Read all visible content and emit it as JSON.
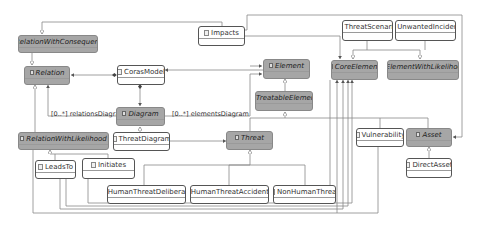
{
  "diagram": {
    "type": "uml-class-diagram",
    "classes": [
      {
        "id": "relationWithConsequence",
        "name": "RelationWithConsequence",
        "abstract": true
      },
      {
        "id": "relation",
        "name": "Relation",
        "abstract": true
      },
      {
        "id": "corasModel",
        "name": "CorasModel",
        "abstract": false
      },
      {
        "id": "impacts",
        "name": "Impacts",
        "abstract": false
      },
      {
        "id": "diagram",
        "name": "Diagram",
        "abstract": true
      },
      {
        "id": "element",
        "name": "Element",
        "abstract": true
      },
      {
        "id": "treatableElement",
        "name": "TreatableElement",
        "abstract": true
      },
      {
        "id": "coreElement",
        "name": "CoreElement",
        "abstract": true
      },
      {
        "id": "elementWithLikelihood",
        "name": "ElementWithLikelihood",
        "abstract": true
      },
      {
        "id": "threatScenario",
        "name": "ThreatScenario",
        "abstract": false
      },
      {
        "id": "unwantedIncident",
        "name": "UnwantedIncident",
        "abstract": false
      },
      {
        "id": "relationWithLikelihood",
        "name": "RelationWithLikelihood",
        "abstract": true
      },
      {
        "id": "threatDiagram",
        "name": "ThreatDiagram",
        "abstract": false
      },
      {
        "id": "leadsTo",
        "name": "LeadsTo",
        "abstract": false
      },
      {
        "id": "initiates",
        "name": "Initiates",
        "abstract": false
      },
      {
        "id": "threat",
        "name": "Threat",
        "abstract": true
      },
      {
        "id": "vulnerability",
        "name": "Vulnerability",
        "abstract": false
      },
      {
        "id": "asset",
        "name": "Asset",
        "abstract": true
      },
      {
        "id": "directAsset",
        "name": "DirectAsset",
        "abstract": false
      },
      {
        "id": "humanThreatDeliberate",
        "name": "HumanThreatDeliberate",
        "abstract": false
      },
      {
        "id": "humanThreatAccidental",
        "name": "HumanThreatAccidental",
        "abstract": false
      },
      {
        "id": "nonHumanThreat",
        "name": "NonHumanThreat",
        "abstract": false
      }
    ],
    "association_labels": {
      "relationsDiagram": "[0..*] relationsDiagram",
      "elementsDiagram": "[0..*] elementsDiagram"
    },
    "colors": {
      "abstract_fill": "#a6a6a6",
      "concrete_fill": "#ffffff",
      "line": "#777777"
    }
  }
}
